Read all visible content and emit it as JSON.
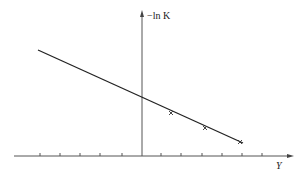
{
  "diagram": {
    "y_axis_label": "−ln K",
    "x_axis_label": "Y",
    "line": {
      "start": [
        38,
        50
      ],
      "intercept": [
        142,
        97
      ],
      "end": [
        243,
        143
      ]
    },
    "points": [
      [
        171,
        113
      ],
      [
        205,
        128
      ],
      [
        240,
        142
      ]
    ],
    "x_ticks_px": [
      40,
      60,
      80,
      100,
      122,
      161,
      181,
      202,
      222,
      242,
      262
    ],
    "colors": {
      "axis": "#555555",
      "line": "#222222"
    }
  }
}
